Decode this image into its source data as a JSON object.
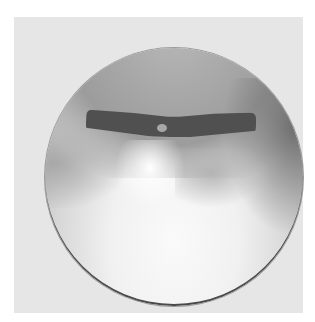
{
  "image": {
    "description": "Grayscale circular endoscopic view with a dark segmented band across the upper portion and a small light dot at its center",
    "colors": {
      "page_background": "#ffffff",
      "frame_background": "#e6e6e6",
      "band": "#505050",
      "highlight": "#fafafa"
    }
  }
}
